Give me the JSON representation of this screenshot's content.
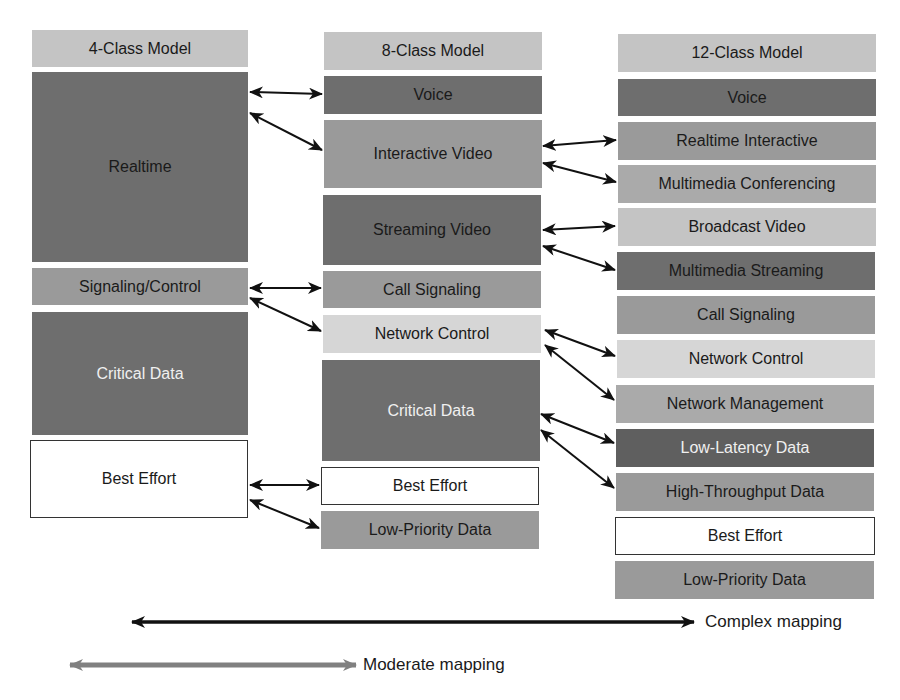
{
  "diagram": {
    "columns": [
      {
        "header": "4-Class Model",
        "classes": [
          {
            "label": "Realtime"
          },
          {
            "label": "Signaling/Control"
          },
          {
            "label": "Critical Data"
          },
          {
            "label": "Best Effort"
          }
        ]
      },
      {
        "header": "8-Class Model",
        "classes": [
          {
            "label": "Voice"
          },
          {
            "label": "Interactive Video"
          },
          {
            "label": "Streaming Video"
          },
          {
            "label": "Call Signaling"
          },
          {
            "label": "Network Control"
          },
          {
            "label": "Critical Data"
          },
          {
            "label": "Best Effort"
          },
          {
            "label": "Low-Priority Data"
          }
        ]
      },
      {
        "header": "12-Class Model",
        "classes": [
          {
            "label": "Voice"
          },
          {
            "label": "Realtime Interactive"
          },
          {
            "label": "Multimedia Conferencing"
          },
          {
            "label": "Broadcast Video"
          },
          {
            "label": "Multimedia Streaming"
          },
          {
            "label": "Call Signaling"
          },
          {
            "label": "Network Control"
          },
          {
            "label": "Network Management"
          },
          {
            "label": "Low-Latency Data"
          },
          {
            "label": "High-Throughput Data"
          },
          {
            "label": "Best Effort"
          },
          {
            "label": "Low-Priority Data"
          }
        ]
      }
    ],
    "mappings_4_to_8": [
      [
        "Realtime",
        "Voice"
      ],
      [
        "Realtime",
        "Interactive Video"
      ],
      [
        "Signaling/Control",
        "Call Signaling"
      ],
      [
        "Signaling/Control",
        "Network Control"
      ],
      [
        "Best Effort",
        "Best Effort"
      ],
      [
        "Best Effort",
        "Low-Priority Data"
      ]
    ],
    "mappings_8_to_12": [
      [
        "Interactive Video",
        "Realtime Interactive"
      ],
      [
        "Interactive Video",
        "Multimedia Conferencing"
      ],
      [
        "Streaming Video",
        "Broadcast Video"
      ],
      [
        "Streaming Video",
        "Multimedia Streaming"
      ],
      [
        "Network Control",
        "Network Control"
      ],
      [
        "Network Control",
        "Network Management"
      ],
      [
        "Critical Data",
        "Low-Latency Data"
      ],
      [
        "Critical Data",
        "High-Throughput Data"
      ]
    ],
    "legend": {
      "complex": "Complex mapping",
      "moderate": "Moderate mapping"
    }
  }
}
